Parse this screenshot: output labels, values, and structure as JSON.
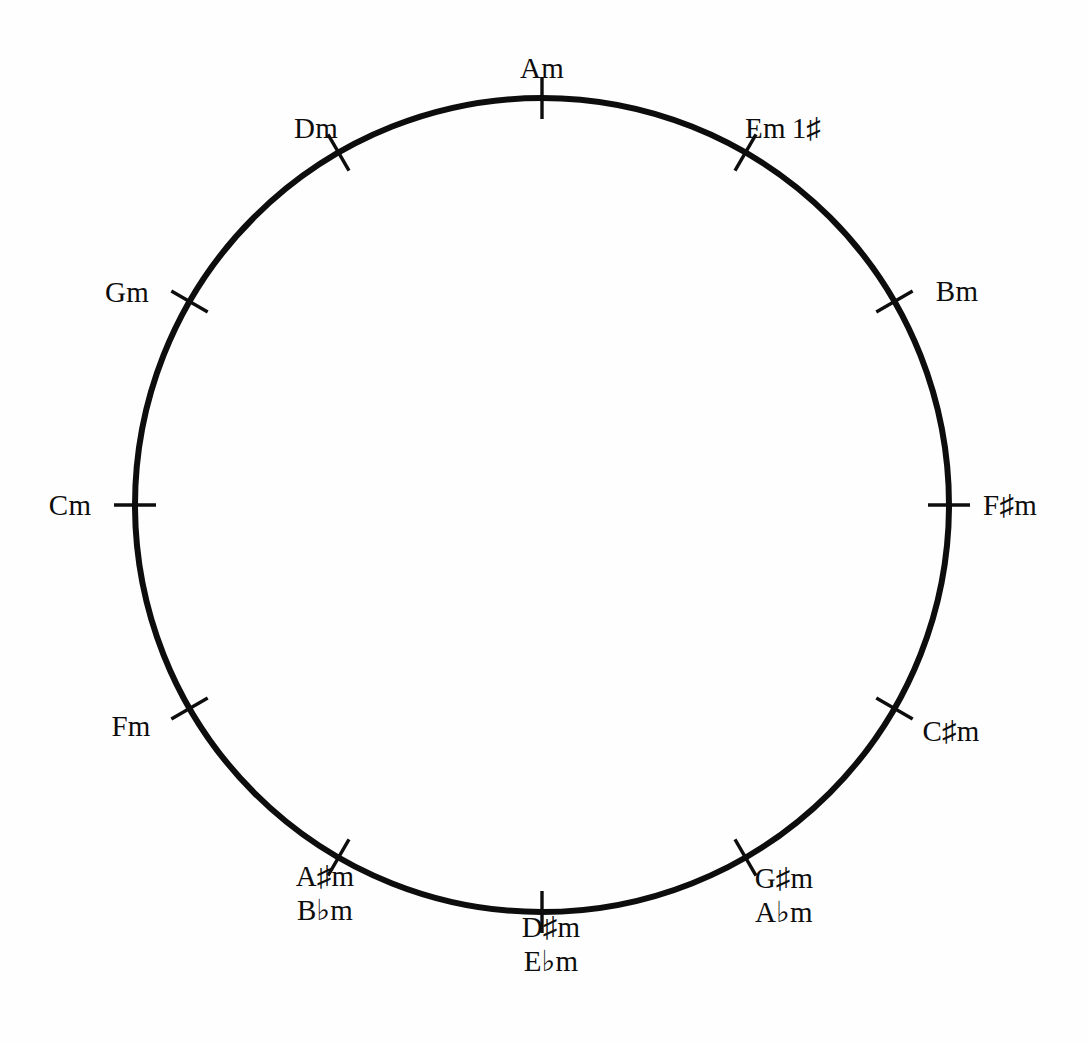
{
  "figure": {
    "background_color": "#fefefe",
    "ink_color": "#0d0d0d"
  },
  "circle": {
    "center_x": 542,
    "center_y": 505,
    "radius": 407,
    "stroke_width": 6
  },
  "chart_data": {
    "type": "scatter",
    "xlabel": "",
    "ylabel": "",
    "grid": false,
    "legend": null,
    "categories": [
      "Am",
      "Em",
      "Bm",
      "F#m",
      "C#m",
      "G#m/Abm",
      "D#m/Ebm",
      "A#m/Bbm",
      "Fm",
      "Cm",
      "Gm",
      "Dm"
    ],
    "values": [
      0,
      30,
      60,
      90,
      120,
      150,
      180,
      210,
      240,
      270,
      300,
      330
    ],
    "units": "degrees clockwise from top"
  },
  "nodes": [
    {
      "id": "am",
      "angle_deg": 0,
      "label_primary": "Am",
      "label_enharmonic": "",
      "signature": "",
      "label_x": 542,
      "label_y": 68,
      "tick": true
    },
    {
      "id": "em",
      "angle_deg": 30,
      "label_primary": "Em",
      "label_enharmonic": "",
      "signature": "1♯",
      "label_x": 783,
      "label_y": 128,
      "tick": true
    },
    {
      "id": "bm",
      "angle_deg": 60,
      "label_primary": "Bm",
      "label_enharmonic": "",
      "signature": "",
      "label_x": 957,
      "label_y": 291,
      "tick": true
    },
    {
      "id": "fsharpm",
      "angle_deg": 90,
      "label_primary": "F♯m",
      "label_enharmonic": "",
      "signature": "",
      "label_x": 1010,
      "label_y": 505,
      "tick": true
    },
    {
      "id": "csharpm",
      "angle_deg": 120,
      "label_primary": "C♯m",
      "label_enharmonic": "",
      "signature": "",
      "label_x": 951,
      "label_y": 731,
      "tick": true
    },
    {
      "id": "gsharpm",
      "angle_deg": 150,
      "label_primary": "G♯m",
      "label_enharmonic": "A♭m",
      "signature": "",
      "label_x": 784,
      "label_y": 895,
      "tick": true
    },
    {
      "id": "dsharpm",
      "angle_deg": 180,
      "label_primary": "D♯m",
      "label_enharmonic": "E♭m",
      "signature": "",
      "label_x": 551,
      "label_y": 944,
      "tick": true
    },
    {
      "id": "asharpm",
      "angle_deg": 210,
      "label_primary": "A♯m",
      "label_enharmonic": "B♭m",
      "signature": "",
      "label_x": 325,
      "label_y": 893,
      "tick": true
    },
    {
      "id": "fm",
      "angle_deg": 240,
      "label_primary": "Fm",
      "label_enharmonic": "",
      "signature": "",
      "label_x": 131,
      "label_y": 726,
      "tick": true
    },
    {
      "id": "cm",
      "angle_deg": 270,
      "label_primary": "Cm",
      "label_enharmonic": "",
      "signature": "",
      "label_x": 70,
      "label_y": 505,
      "tick": true
    },
    {
      "id": "gm",
      "angle_deg": 300,
      "label_primary": "Gm",
      "label_enharmonic": "",
      "signature": "",
      "label_x": 127,
      "label_y": 292,
      "tick": true
    },
    {
      "id": "dm",
      "angle_deg": 330,
      "label_primary": "Dm",
      "label_enharmonic": "",
      "signature": "",
      "label_x": 316,
      "label_y": 128,
      "tick": true
    }
  ]
}
